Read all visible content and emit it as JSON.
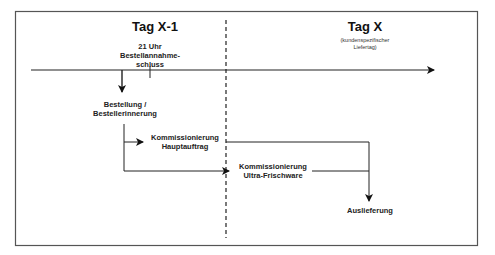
{
  "diagram": {
    "left_title": "Tag X-1",
    "right_title": "Tag X",
    "right_subtitle_line1": "(kundenspezifischer",
    "right_subtitle_line2": "Liefertag)",
    "cutoff_line1": "21 Uhr",
    "cutoff_line2": "Bestellannahme-",
    "cutoff_line3": "schluss",
    "order_line1": "Bestellung /",
    "order_line2": "Bestellerinnerung",
    "pick_main_line1": "Kommissionierung",
    "pick_main_line2": "Hauptauftrag",
    "pick_fresh_line1": "Kommissionierung",
    "pick_fresh_line2": "Ultra-Frischware",
    "delivery": "Auslieferung"
  }
}
